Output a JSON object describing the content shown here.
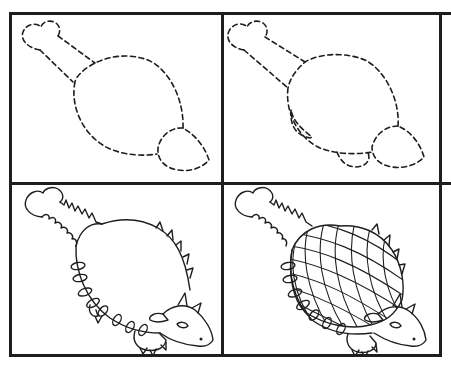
{
  "tutorial": {
    "subject": "ankylosaurus",
    "colors": {
      "ink": "#1e1e1e",
      "paper": "#ffffff"
    },
    "steps": [
      {
        "step": 1,
        "description": "Dashed guide: tail club + tail, oval body, round head"
      },
      {
        "step": 2,
        "description": "Dashed guide with legs added"
      },
      {
        "step": 3,
        "description": "Solid outline with spikes, face and feet"
      },
      {
        "step": 4,
        "description": "Finished drawing with armored grid shell"
      }
    ]
  }
}
